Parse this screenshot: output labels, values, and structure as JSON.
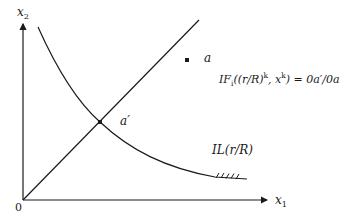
{
  "diagram": {
    "type": "isoquant-ray-diagram",
    "axes": {
      "x_label_base": "x",
      "x_label_sub": "1",
      "y_label_base": "x",
      "y_label_sub": "2",
      "origin_label": "0"
    },
    "points": {
      "a_label": "a",
      "a_prime_label": "a′"
    },
    "curve": {
      "label": "IL(r/R)"
    },
    "equation": {
      "prefix": "IF",
      "sub": "i",
      "mid1": "((r/R)",
      "sup1": "k",
      "mid2": ", x",
      "sup2": "k",
      "suffix": ") = 0a′/0a"
    },
    "colors": {
      "ink": "#1a1a1a",
      "background": "#ffffff"
    }
  }
}
